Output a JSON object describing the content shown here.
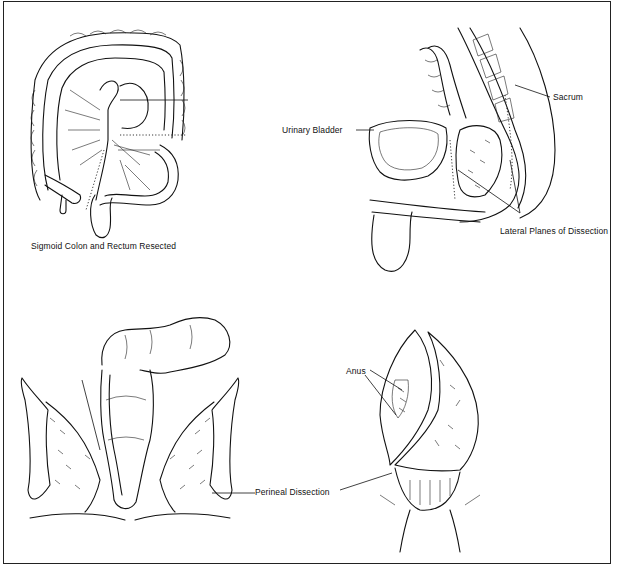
{
  "figure": {
    "panels": [
      {
        "id": "sigmoid-resection",
        "caption": "Sigmoid Colon and Rectum Resected"
      },
      {
        "id": "pelvic-sagittal",
        "labels": {
          "sacrum": "Sacrum",
          "urinary_bladder": "Urinary Bladder",
          "lateral_planes": "Lateral Planes of Dissection"
        }
      },
      {
        "id": "perineal-dissection",
        "labels": {
          "perineal_dissection": "Perineal Dissection"
        }
      },
      {
        "id": "anal-closure",
        "labels": {
          "anus": "Anus"
        }
      }
    ],
    "colors": {
      "ink": "#111111",
      "background": "#ffffff",
      "border": "#222222"
    }
  }
}
